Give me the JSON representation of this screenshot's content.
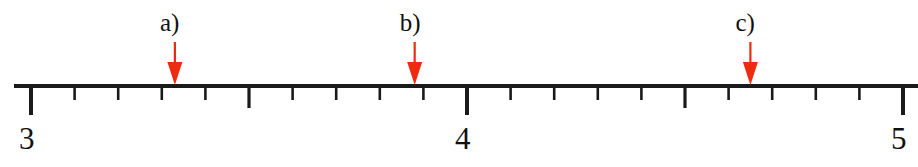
{
  "figure": {
    "background_color": "#ffffff",
    "line_color": "#1a1a1a",
    "arrow_color": "#ee2a10"
  },
  "chart_data": {
    "type": "line",
    "subtype": "number-line",
    "title": "",
    "xlabel": "",
    "ylabel": "",
    "xlim": [
      2.96,
      5.03
    ],
    "grid": false,
    "legend": null,
    "orientation": "horizontal",
    "axis": {
      "min": 3,
      "max": 5,
      "major_tick_interval": 1,
      "medium_tick_interval": 0.5,
      "minor_tick_interval": 0.1
    },
    "tick_labels": [
      {
        "value": 3,
        "text": "3"
      },
      {
        "value": 4,
        "text": "4"
      },
      {
        "value": 5,
        "text": "5"
      }
    ],
    "major_ticks": [
      3,
      4,
      5
    ],
    "medium_ticks": [
      3.5,
      4.5
    ],
    "minor_ticks": [
      3.1,
      3.2,
      3.3,
      3.4,
      3.6,
      3.7,
      3.8,
      3.9,
      4.1,
      4.2,
      4.3,
      4.4,
      4.6,
      4.7,
      4.8,
      4.9
    ],
    "annotations": [
      {
        "label": "a)",
        "value": 3.33,
        "color": "#ee2a10"
      },
      {
        "label": "b)",
        "value": 3.88,
        "color": "#ee2a10"
      },
      {
        "label": "c)",
        "value": 4.65,
        "color": "#ee2a10"
      }
    ]
  }
}
